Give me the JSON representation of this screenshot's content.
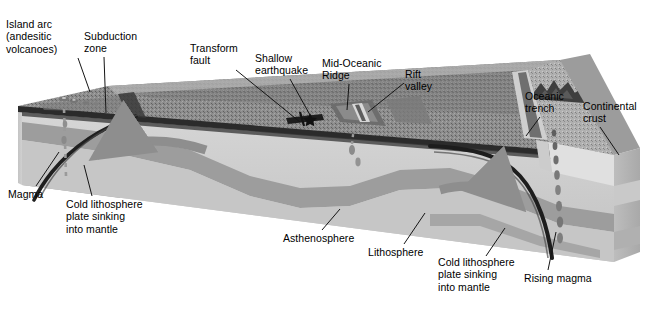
{
  "palette": {
    "background": "#ffffff",
    "text": "#000000",
    "leader_line": "#1a1a1a",
    "ocean_surface_dark": "#6f6f6f",
    "ocean_surface_mid": "#8a8a8a",
    "ocean_surface_light": "#a5a5a5",
    "crust_band_dark": "#2e2e2e",
    "lithosphere": "#9a9a9a",
    "asthenosphere": "#c9c9c9",
    "deep_mantle": "#b3b3b3",
    "side_face_light": "#d2d2d2",
    "side_face_mid": "#bcbcbc",
    "continental_crust": "#b8b8b8",
    "slab": "#232323",
    "convection_arrow": "#8e8e8e",
    "magma_blob": "#7a7a7a"
  },
  "labels": [
    {
      "id": "island-arc",
      "name": "island-arc-label",
      "lines": [
        "Island arc",
        "(andesitic",
        "volcanoes)"
      ],
      "text": "Island arc (andesitic volcanoes)",
      "x": 6,
      "y": 18,
      "leader": [
        [
          78,
          58
        ],
        [
          90,
          92
        ]
      ]
    },
    {
      "id": "subduction-zone",
      "name": "subduction-zone-label",
      "lines": [
        "Subduction",
        "zone"
      ],
      "text": "Subduction zone",
      "x": 84,
      "y": 30,
      "leader": [
        [
          104,
          57
        ],
        [
          106,
          113
        ]
      ]
    },
    {
      "id": "transform-fault",
      "name": "transform-fault-label",
      "lines": [
        "Transform",
        "fault"
      ],
      "text": "Transform fault",
      "x": 190,
      "y": 42,
      "leader": [
        [
          236,
          70
        ],
        [
          300,
          122
        ]
      ]
    },
    {
      "id": "shallow-earthquake",
      "name": "shallow-earthquake-label",
      "lines": [
        "Shallow",
        "earthquake"
      ],
      "text": "Shallow earthquake",
      "x": 255,
      "y": 52,
      "leader": [
        [
          290,
          79
        ],
        [
          310,
          115
        ]
      ]
    },
    {
      "id": "mid-oceanic-ridge",
      "name": "mid-oceanic-ridge-label",
      "lines": [
        "Mid-Oceanic",
        "Ridge"
      ],
      "text": "Mid-Oceanic Ridge",
      "x": 322,
      "y": 57,
      "leader": [
        [
          349,
          84
        ],
        [
          347,
          110
        ]
      ]
    },
    {
      "id": "rift-valley",
      "name": "rift-valley-label",
      "lines": [
        "Rift",
        "valley"
      ],
      "text": "Rift valley",
      "x": 405,
      "y": 68,
      "leader": [
        [
          404,
          83
        ],
        [
          368,
          112
        ]
      ]
    },
    {
      "id": "oceanic-trench",
      "name": "oceanic-trench-label",
      "lines": [
        "Oceanic",
        "trench"
      ],
      "text": "Oceanic trench",
      "x": 525,
      "y": 90,
      "leader": [
        [
          540,
          117
        ],
        [
          526,
          136
        ]
      ]
    },
    {
      "id": "continental-crust",
      "name": "continental-crust-label",
      "lines": [
        "Continental",
        "crust"
      ],
      "text": "Continental crust",
      "x": 583,
      "y": 100,
      "leader": [
        [
          600,
          127
        ],
        [
          619,
          155
        ]
      ]
    },
    {
      "id": "magma",
      "name": "magma-label",
      "lines": [
        "Magma"
      ],
      "text": "Magma",
      "x": 8,
      "y": 188,
      "leader": [
        [
          36,
          186
        ],
        [
          59,
          152
        ]
      ]
    },
    {
      "id": "cold-slab-left",
      "name": "cold-lithosphere-plate-sinking-left-label",
      "lines": [
        "Cold lithosphere",
        "plate sinking",
        "into mantle"
      ],
      "text": "Cold lithosphere plate sinking into mantle",
      "x": 66,
      "y": 198,
      "leader": [
        [
          92,
          196
        ],
        [
          84,
          165
        ]
      ]
    },
    {
      "id": "asthenosphere",
      "name": "asthenosphere-label",
      "lines": [
        "Asthenosphere"
      ],
      "text": "Asthenosphere",
      "x": 283,
      "y": 232,
      "leader": [
        [
          322,
          230
        ],
        [
          340,
          209
        ]
      ]
    },
    {
      "id": "lithosphere",
      "name": "lithosphere-label",
      "lines": [
        "Lithosphere"
      ],
      "text": "Lithosphere",
      "x": 368,
      "y": 246,
      "leader": [
        [
          404,
          244
        ],
        [
          425,
          213
        ]
      ]
    },
    {
      "id": "cold-slab-right",
      "name": "cold-lithosphere-plate-sinking-right-label",
      "lines": [
        "Cold lithosphere",
        "plate sinking",
        "into mantle"
      ],
      "text": "Cold lithosphere plate sinking into mantle",
      "x": 438,
      "y": 256,
      "leader": [
        [
          486,
          256
        ],
        [
          505,
          228
        ]
      ]
    },
    {
      "id": "rising-magma",
      "name": "rising-magma-label",
      "lines": [
        "Rising magma"
      ],
      "text": "Rising magma",
      "x": 524,
      "y": 272,
      "leader": [
        [
          548,
          270
        ],
        [
          556,
          232
        ]
      ]
    }
  ],
  "features": {
    "volcanoes": "island-arc-volcanoes",
    "earthquake_marker": "shallow-earthquake-star",
    "convection_arrow_left": "mantle-convection-arrow-left",
    "convection_arrow_right": "mantle-convection-arrow-right",
    "rising_magma_dashes_left": "magma-ascent-dashes-left",
    "rising_magma_dashes_right": "magma-ascent-dashes-right",
    "subducting_slab_left": "subducting-slab-left",
    "subducting_slab_right": "subducting-slab-right"
  }
}
